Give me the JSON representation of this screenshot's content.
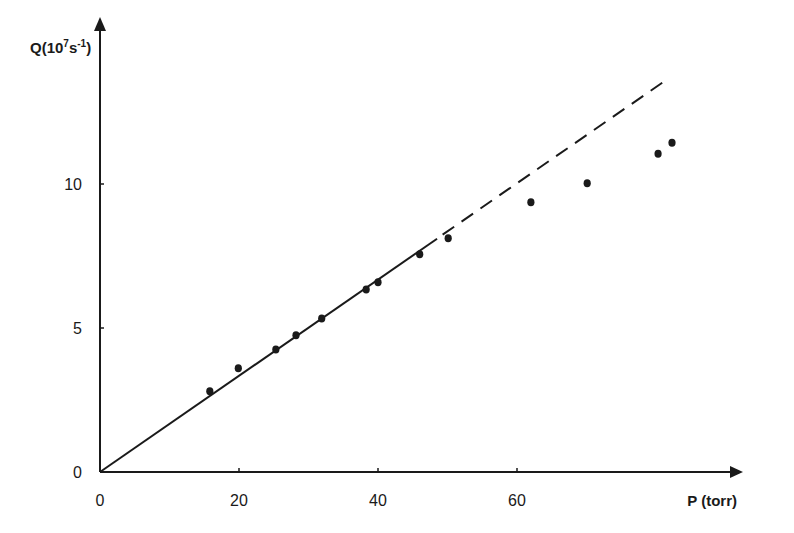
{
  "chart_data": {
    "type": "scatter",
    "title": "",
    "xlabel": "P (torr)",
    "ylabel": "Q(10⁷s⁻¹)",
    "ylabel_parts": {
      "base": "Q(10",
      "sup1": "7",
      "mid": "s",
      "sup2": "-1",
      "end": ")"
    },
    "xlim": [
      0,
      92
    ],
    "ylim": [
      0,
      15.8
    ],
    "x_ticks": [
      0,
      20,
      40,
      60
    ],
    "x_tick_labels": [
      "0",
      "20",
      "40",
      "60"
    ],
    "y_ticks": [
      0,
      5,
      10
    ],
    "y_tick_labels": [
      "0",
      "5",
      "10"
    ],
    "grid": false,
    "legend": null,
    "series": [
      {
        "name": "measured",
        "type": "scatter",
        "x": [
          15.8,
          19.9,
          25.3,
          28.2,
          31.9,
          38.3,
          40.0,
          46.0,
          50.1,
          62.0,
          70.1,
          80.3,
          82.3
        ],
        "y": [
          2.8,
          3.6,
          4.25,
          4.75,
          5.33,
          6.34,
          6.59,
          7.56,
          8.12,
          9.37,
          10.03,
          11.05,
          11.43
        ]
      },
      {
        "name": "linear fit (solid)",
        "type": "line",
        "style": "solid",
        "x": [
          0,
          48.5
        ],
        "y": [
          0,
          8.1
        ]
      },
      {
        "name": "linear extrapolation (dashed)",
        "type": "line",
        "style": "dashed",
        "x": [
          49.3,
          81.4
        ],
        "y": [
          8.24,
          13.6
        ]
      }
    ]
  },
  "colors": {
    "ink": "#1a1a1a",
    "background": "#ffffff"
  }
}
